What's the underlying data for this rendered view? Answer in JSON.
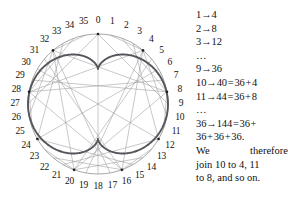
{
  "figure": {
    "caption_absent": true,
    "diagram": {
      "type": "chord-envelope-circle",
      "point_count": 36,
      "multiplier": 4,
      "modulus": 36,
      "center": {
        "x": 98,
        "y": 104
      },
      "radius": 70,
      "label_radius": 83,
      "colors": {
        "envelope": "#55555b",
        "chord": "#9a9a9e",
        "circle": "#8a8a8e",
        "label": "#111111",
        "background": "#ffffff"
      },
      "labels": [
        "0",
        "1",
        "2",
        "3",
        "4",
        "5",
        "6",
        "7",
        "8",
        "9",
        "10",
        "11",
        "12",
        "13",
        "14",
        "15",
        "16",
        "17",
        "18",
        "19",
        "20",
        "21",
        "22",
        "23",
        "24",
        "25",
        "26",
        "27",
        "28",
        "29",
        "30",
        "31",
        "32",
        "33",
        "34",
        "35"
      ]
    }
  },
  "chart_data": {
    "type": "scatter",
    "title": "",
    "subtitle": "",
    "xlabel": "",
    "ylabel": "",
    "grid": false,
    "legend": "none",
    "point_count": 36,
    "rule": "n -> 4n (mod 36)",
    "categories": [
      "0",
      "1",
      "2",
      "3",
      "4",
      "5",
      "6",
      "7",
      "8",
      "9",
      "10",
      "11",
      "12",
      "13",
      "14",
      "15",
      "16",
      "17",
      "18",
      "19",
      "20",
      "21",
      "22",
      "23",
      "24",
      "25",
      "26",
      "27",
      "28",
      "29",
      "30",
      "31",
      "32",
      "33",
      "34",
      "35"
    ],
    "values": [
      0,
      4,
      8,
      12,
      16,
      20,
      24,
      28,
      32,
      0,
      4,
      8,
      12,
      16,
      20,
      24,
      28,
      32,
      0,
      4,
      8,
      12,
      16,
      20,
      24,
      28,
      32,
      0,
      4,
      8,
      12,
      16,
      20,
      24,
      28,
      32
    ]
  },
  "explanation": {
    "lines": [
      {
        "id": "l1",
        "text": "1→4"
      },
      {
        "id": "l2",
        "text": "2→8"
      },
      {
        "id": "l3",
        "text": "3→12"
      },
      {
        "id": "l4",
        "text": "…"
      },
      {
        "id": "l5",
        "text": "9→36"
      },
      {
        "id": "l6",
        "text": "10→40 = 36 + 4"
      },
      {
        "id": "l7",
        "text": "11→44 = 36 + 8"
      },
      {
        "id": "l8",
        "text": "…"
      },
      {
        "id": "l9",
        "text": "36→144 = 36 +"
      },
      {
        "id": "l10",
        "text": "36 + 36 + 36."
      }
    ],
    "prose": {
      "line1_a": "We",
      "line1_b": "therefore",
      "line2": "join 10 to 4, 11",
      "line3": "to 8, and so on."
    }
  }
}
